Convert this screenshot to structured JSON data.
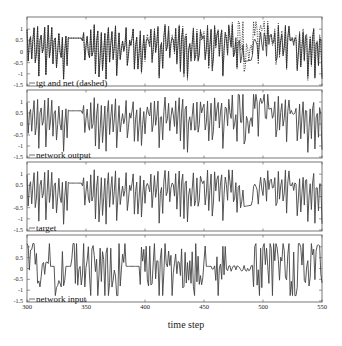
{
  "chart_data": {
    "type": "line",
    "title": "",
    "xlabel": "time step",
    "ylabel": "",
    "xlim": [
      300,
      550
    ],
    "x_ticks": [
      300,
      350,
      400,
      450,
      500,
      550
    ],
    "grid": false,
    "panels": [
      {
        "label": "tgt and net (dashed)",
        "ylim": [
          -1.5,
          1.5
        ],
        "y_ticks": [
          "1",
          "0.5",
          "0",
          "-0.5",
          "-1",
          "-1.5"
        ],
        "series": [
          {
            "name": "target",
            "style": "solid"
          },
          {
            "name": "network output",
            "style": "dashed"
          }
        ],
        "notes": "network (dashed) deviates from target mainly for t>400, largest near t=480-505"
      },
      {
        "label": "network output",
        "ylim": [
          -1.5,
          1.5
        ],
        "y_ticks": [
          "1",
          "0.5",
          "0",
          "-0.5",
          "-1",
          "-1.5"
        ],
        "series": [
          {
            "name": "network output",
            "style": "solid"
          }
        ]
      },
      {
        "label": "target",
        "ylim": [
          -1.5,
          1.5
        ],
        "y_ticks": [
          "1",
          "0.5",
          "0",
          "-0.5",
          "-1",
          "-1.5"
        ],
        "series": [
          {
            "name": "target",
            "style": "solid"
          }
        ],
        "notes": "flat segments near t=335-345 and t=485-490"
      },
      {
        "label": "network input",
        "ylim": [
          -1.5,
          1.5
        ],
        "y_ticks": [
          "1",
          "0.5",
          "0",
          "-0.5",
          "-1",
          "-1.5"
        ],
        "series": [
          {
            "name": "network input",
            "style": "solid"
          }
        ],
        "notes": "flat segments near t=320, 335, 385-395, 455, 470-490"
      }
    ],
    "signal_description": "chaotic oscillations roughly between -1.3 and 1.2 over time steps 300-550"
  },
  "labels": {
    "xlabel": "time step"
  }
}
